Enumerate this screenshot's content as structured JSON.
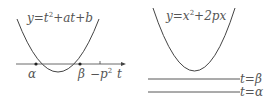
{
  "left_panel": {
    "equation": {
      "y": "y",
      "eq": "=",
      "t": "t",
      "sup": "2",
      "rest": "+at+b"
    },
    "axis_label": "t",
    "root_alpha": "α",
    "root_beta": "β",
    "tick_label": {
      "minus": "−",
      "p": "p",
      "sup": "2"
    }
  },
  "right_panel": {
    "equation": {
      "y": "y",
      "eq": "=",
      "x": "x",
      "sup": "2",
      "rest": "+2px"
    },
    "line_beta": "t=β",
    "line_alpha": "t=α"
  },
  "colors": {
    "stroke": "#444444",
    "text": "#555555"
  }
}
